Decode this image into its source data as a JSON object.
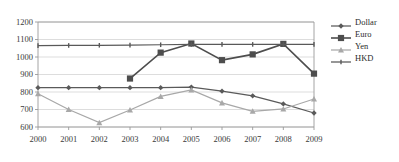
{
  "chart_data": {
    "type": "line",
    "title": "",
    "xlabel": "",
    "ylabel": "",
    "categories": [
      "2000",
      "2001",
      "2002",
      "2003",
      "2004",
      "2005",
      "2006",
      "2007",
      "2008",
      "2009"
    ],
    "ylim": [
      600,
      1200
    ],
    "ytick_step": 100,
    "yticks": [
      "600",
      "700",
      "800",
      "900",
      "1000",
      "1100",
      "1200"
    ],
    "grid": true,
    "legend_position": "right",
    "series": [
      {
        "name": "Dollar",
        "marker": "diamond",
        "color": "#5a5a5a",
        "values": [
          825,
          825,
          825,
          825,
          825,
          828,
          805,
          778,
          732,
          680
        ]
      },
      {
        "name": "Euro",
        "marker": "square",
        "color": "#4d4d4d",
        "values": [
          null,
          null,
          null,
          877,
          1025,
          1077,
          982,
          1015,
          1075,
          905
        ]
      },
      {
        "name": "Yen",
        "marker": "triangle",
        "color": "#a8a8a8",
        "values": [
          790,
          700,
          625,
          697,
          775,
          812,
          738,
          690,
          703,
          760
        ]
      },
      {
        "name": "HKD",
        "marker": "line",
        "color": "#595959",
        "values": [
          1065,
          1066,
          1067,
          1068,
          1070,
          1072,
          1072,
          1072,
          1072,
          1072
        ]
      }
    ]
  },
  "legend": {
    "items": [
      {
        "label": "Dollar"
      },
      {
        "label": "Euro"
      },
      {
        "label": "Yen"
      },
      {
        "label": "HKD"
      }
    ]
  }
}
